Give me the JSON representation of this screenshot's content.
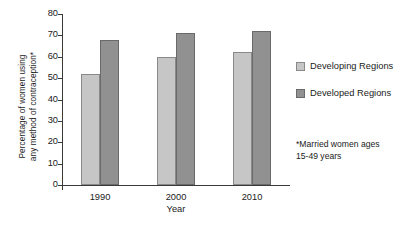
{
  "chart_data": {
    "type": "bar",
    "title": "",
    "subtitle": "",
    "xlabel": "Year",
    "ylabel": "Percentage of women using\nany method of contraception*",
    "categories": [
      "1990",
      "2000",
      "2010"
    ],
    "series": [
      {
        "name": "Developing Regions",
        "values": [
          52,
          60,
          62
        ],
        "color": "#c6c6c6"
      },
      {
        "name": "Developed Regions",
        "values": [
          68,
          71,
          72
        ],
        "color": "#919191"
      }
    ],
    "ylim": [
      0,
      80
    ],
    "ytick_labels": [
      "0",
      "10",
      "20",
      "30",
      "40",
      "50",
      "60",
      "70",
      "80"
    ],
    "ytick_values": [
      0,
      10,
      20,
      30,
      40,
      50,
      60,
      70,
      80
    ],
    "grid": false,
    "legend_position": "right",
    "annotations": [
      "*Married women ages\n15-49 years"
    ]
  },
  "footnote": "*Married women ages\n15-49 years",
  "axis": {
    "x_title": "Year",
    "y_title": "Percentage of women using\nany method of contraception*"
  },
  "legend": {
    "items": [
      {
        "label": "Developing Regions"
      },
      {
        "label": "Developed Regions"
      }
    ]
  }
}
